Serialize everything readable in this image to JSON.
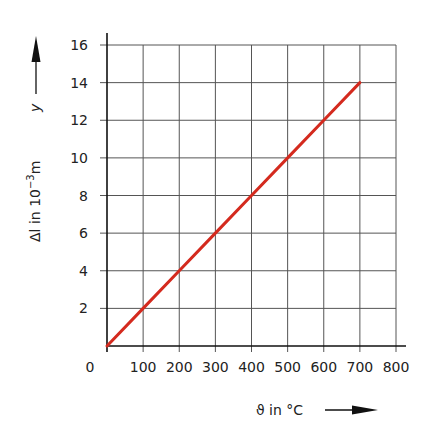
{
  "chart_data": {
    "type": "line",
    "title": "",
    "xlabel": "ϑ in °C",
    "ylabel": "Δl in 10⁻³m",
    "ylabel_symbol": "y",
    "xlim": [
      0,
      800
    ],
    "ylim": [
      0,
      16
    ],
    "x_ticks": [
      0,
      100,
      200,
      300,
      400,
      500,
      600,
      700,
      800
    ],
    "y_ticks": [
      2,
      4,
      6,
      8,
      10,
      12,
      14,
      16
    ],
    "grid": true,
    "legend": null,
    "series": [
      {
        "name": "Δl",
        "color": "#d42a1e",
        "x": [
          0,
          100,
          200,
          300,
          400,
          500,
          600,
          700
        ],
        "y": [
          0,
          2,
          4,
          6,
          8,
          10,
          12,
          14
        ]
      }
    ]
  },
  "labels": {
    "x_axis_title": "ϑ in °C",
    "y_axis_title_main": "Δl in 10",
    "y_axis_title_exp": "−3",
    "y_axis_title_unit": "m",
    "y_axis_symbol": "y",
    "x_origin": "0"
  },
  "colors": {
    "line": "#d42a1e",
    "grid": "#555555",
    "axis": "#111111"
  }
}
